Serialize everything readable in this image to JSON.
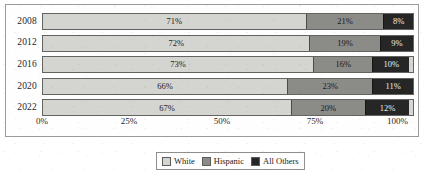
{
  "chart_data": {
    "type": "bar",
    "subtype": "stacked-horizontal-100pct",
    "title": "",
    "xlabel": "",
    "ylabel": "",
    "categories": [
      "2008",
      "2012",
      "2016",
      "2020",
      "2022"
    ],
    "series": [
      {
        "name": "White",
        "color": "#d4d4d1",
        "values": [
          71,
          72,
          73,
          66,
          67
        ],
        "labels": [
          "71%",
          "72%",
          "73%",
          "66%",
          "67%"
        ]
      },
      {
        "name": "Hispanic",
        "color": "#8b8b88",
        "values": [
          21,
          19,
          16,
          23,
          20
        ],
        "labels": [
          "21%",
          "19%",
          "16%",
          "23%",
          "20%"
        ]
      },
      {
        "name": "All Others",
        "color": "#262626",
        "values": [
          8,
          9,
          10,
          11,
          12
        ],
        "labels": [
          "8%",
          "9%",
          "10%",
          "11%",
          "12%"
        ]
      }
    ],
    "xlim": [
      0,
      100
    ],
    "xticks": [
      0,
      25,
      50,
      75,
      100
    ],
    "xtick_labels": [
      "0%",
      "25%",
      "50%",
      "75%",
      "100%"
    ],
    "grid": false,
    "legend_position": "bottom",
    "legend_entries": [
      "White",
      "Hispanic",
      "All Others"
    ]
  },
  "axis": {
    "ticks": [
      {
        "label": "0%",
        "value": 0
      },
      {
        "label": "25%",
        "value": 25
      },
      {
        "label": "50%",
        "value": 50
      },
      {
        "label": "75%",
        "value": 75
      },
      {
        "label": "100%",
        "value": 100
      }
    ]
  },
  "rows": [
    {
      "year": "2008",
      "white": "71%",
      "hispanic": "21%",
      "other": "8%",
      "w": 71,
      "h": 21,
      "o": 8
    },
    {
      "year": "2012",
      "white": "72%",
      "hispanic": "19%",
      "other": "9%",
      "w": 72,
      "h": 19,
      "o": 9
    },
    {
      "year": "2016",
      "white": "73%",
      "hispanic": "16%",
      "other": "10%",
      "w": 73,
      "h": 16,
      "o": 10
    },
    {
      "year": "2020",
      "white": "66%",
      "hispanic": "23%",
      "other": "11%",
      "w": 66,
      "h": 23,
      "o": 11
    },
    {
      "year": "2022",
      "white": "67%",
      "hispanic": "20%",
      "other": "12%",
      "w": 67,
      "h": 20,
      "o": 12
    }
  ],
  "legend": {
    "items": [
      {
        "label": "White",
        "color": "#d4d4d1"
      },
      {
        "label": "Hispanic",
        "color": "#8b8b88"
      },
      {
        "label": "All Others",
        "color": "#262626"
      }
    ]
  }
}
